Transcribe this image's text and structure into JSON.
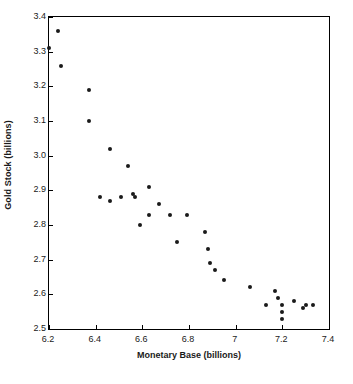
{
  "chart_data": {
    "type": "scatter",
    "title": "",
    "xlabel": "Monetary Base (billions)",
    "ylabel": "Gold Stock (billions)",
    "xlim": [
      6.2,
      7.4
    ],
    "ylim": [
      2.5,
      3.4
    ],
    "xticks": [
      "6.2",
      "6.4",
      "6.6",
      "6.8",
      "7",
      "7.2",
      "7.4"
    ],
    "xtick_values": [
      6.2,
      6.4,
      6.6,
      6.8,
      7.0,
      7.2,
      7.4
    ],
    "yticks": [
      "2.5",
      "2.6",
      "2.7",
      "2.8",
      "2.9",
      "3.0",
      "3.1",
      "3.2",
      "3.3",
      "3.4"
    ],
    "ytick_values": [
      2.5,
      2.6,
      2.7,
      2.8,
      2.9,
      3.0,
      3.1,
      3.2,
      3.3,
      3.4
    ],
    "grid": false,
    "legend": false,
    "marker": "filled-circle",
    "marker_color": "#1a1a1a",
    "series": [
      {
        "name": "Gold Stock vs Monetary Base",
        "points": [
          [
            6.2,
            3.31
          ],
          [
            6.24,
            3.36
          ],
          [
            6.25,
            3.26
          ],
          [
            6.37,
            3.19
          ],
          [
            6.37,
            3.1
          ],
          [
            6.46,
            3.02
          ],
          [
            6.54,
            2.97
          ],
          [
            6.42,
            2.88
          ],
          [
            6.46,
            2.87
          ],
          [
            6.51,
            2.88
          ],
          [
            6.56,
            2.89
          ],
          [
            6.57,
            2.88
          ],
          [
            6.63,
            2.91
          ],
          [
            6.67,
            2.86
          ],
          [
            6.63,
            2.83
          ],
          [
            6.59,
            2.8
          ],
          [
            6.72,
            2.83
          ],
          [
            6.79,
            2.83
          ],
          [
            6.75,
            2.75
          ],
          [
            6.87,
            2.78
          ],
          [
            6.88,
            2.73
          ],
          [
            6.89,
            2.69
          ],
          [
            6.91,
            2.67
          ],
          [
            6.95,
            2.64
          ],
          [
            7.06,
            2.62
          ],
          [
            7.13,
            2.57
          ],
          [
            7.17,
            2.61
          ],
          [
            7.18,
            2.59
          ],
          [
            7.2,
            2.57
          ],
          [
            7.2,
            2.55
          ],
          [
            7.2,
            2.53
          ],
          [
            7.25,
            2.58
          ],
          [
            7.29,
            2.56
          ],
          [
            7.3,
            2.57
          ],
          [
            7.33,
            2.57
          ]
        ]
      }
    ]
  }
}
